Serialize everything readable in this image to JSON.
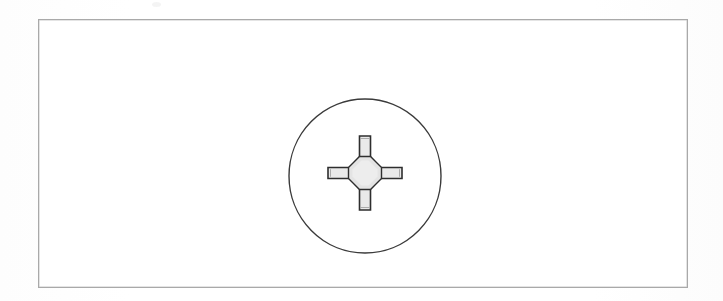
{
  "figure": {
    "kind": "technical-illustration",
    "caption": "",
    "background_color": "#ffffff",
    "frame": {
      "name": "figure-border",
      "border_color": "#a9a9a9",
      "fill_color": "#ffffff",
      "border_width_px": 1,
      "left_px": 38,
      "top_px": 19,
      "width_px": 650,
      "height_px": 269
    },
    "screw_head": {
      "name": "screw-head-circle",
      "center_x_px": 364,
      "center_y_px": 175,
      "radius_px": 77,
      "outline_color": "#3a3a3a",
      "outline_width_px": 1.4,
      "fill_color": "#ffffff"
    },
    "cross_recess": {
      "name": "phillips-cross-recess",
      "outline_color": "#2e2e2e",
      "outline_width_px": 1.6,
      "fill_color": "#e9e9e9",
      "arm_count": 4,
      "arm_length_px": 40,
      "arm_width_px": 11,
      "arm_tip_inset_px": 0,
      "vertical_span_px": [
        135,
        215
      ],
      "horizontal_span_px": [
        324,
        404
      ]
    },
    "center_hub": {
      "name": "cross-center-hub",
      "shape": "octagon",
      "outline_color": "#2e2e2e",
      "fill_color": "#e4e4e4",
      "width_px": 34,
      "height_px": 34,
      "center_x_px": 364,
      "center_y_px": 175
    },
    "scan_artifact": {
      "name": "scan-speck",
      "left_px": 152,
      "top_px": 2,
      "color": "#f2f2f2"
    }
  },
  "canvas": {
    "width_px": 723,
    "height_px": 301
  }
}
